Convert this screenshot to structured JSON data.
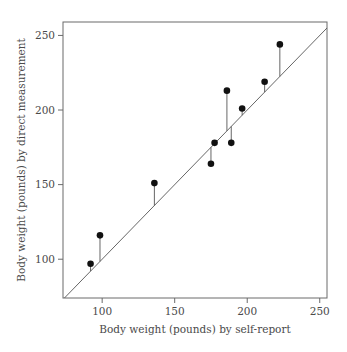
{
  "chart_data": {
    "type": "scatter",
    "title": "",
    "xlabel": "Body weight (pounds) by self-report",
    "ylabel": "Body weight (pounds) by direct measurement",
    "xlim": [
      73,
      255
    ],
    "ylim": [
      74,
      259
    ],
    "xticks": [
      100,
      150,
      200,
      250
    ],
    "yticks": [
      100,
      150,
      200,
      250
    ],
    "grid": false,
    "legend": null,
    "reference_line": {
      "type": "identity",
      "label": "y = x"
    },
    "residual_segments": true,
    "series": [
      {
        "name": "subjects",
        "points": [
          {
            "x": 92,
            "y": 97
          },
          {
            "x": 98.5,
            "y": 116
          },
          {
            "x": 136,
            "y": 151
          },
          {
            "x": 175,
            "y": 164
          },
          {
            "x": 177.5,
            "y": 178
          },
          {
            "x": 186,
            "y": 213
          },
          {
            "x": 189,
            "y": 178
          },
          {
            "x": 196.5,
            "y": 201
          },
          {
            "x": 212,
            "y": 219
          },
          {
            "x": 222.5,
            "y": 244
          }
        ]
      }
    ],
    "colors": {
      "points": "#111111",
      "lines": "#555555",
      "frame": "#6a6a6a",
      "text": "#4a4a4a"
    }
  },
  "axes": {
    "x_title": "Body weight (pounds) by self-report",
    "y_title": "Body weight (pounds) by direct measurement",
    "x_tick_labels": [
      "100",
      "150",
      "200",
      "250"
    ],
    "y_tick_labels": [
      "100",
      "150",
      "200",
      "250"
    ]
  }
}
